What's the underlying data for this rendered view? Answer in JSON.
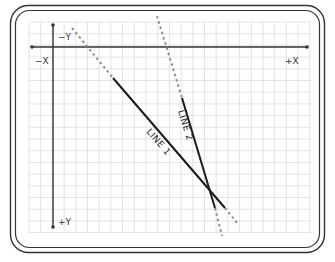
{
  "diagram": {
    "type": "coordinate-plane-lines",
    "axis_labels": {
      "neg_x": "−X",
      "pos_x": "+X",
      "neg_y": "−Y",
      "pos_y": "+Y"
    },
    "lines": [
      {
        "label": "LINE 1",
        "style": "solid with dashed extensions"
      },
      {
        "label": "LINE 2",
        "style": "solid with dashed extensions"
      }
    ],
    "colors": {
      "line": "#1a1a1a",
      "dashed": "#8c8c8c",
      "grid": "#d9d9d9",
      "frame": "#333333",
      "axis": "#333333"
    }
  }
}
